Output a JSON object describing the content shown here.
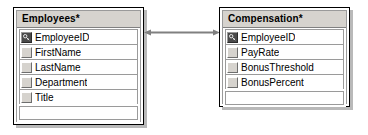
{
  "diagram": {
    "type": "database-relationship-diagram",
    "background_color": "#ffffff",
    "header_color": "#d6d3ce",
    "border_color": "#000000",
    "shadow_color": "#b9b9b9",
    "line_color": "#808080"
  },
  "tables": [
    {
      "title": "Employees*",
      "fields": [
        {
          "name": "EmployeeID",
          "is_primary_key": true
        },
        {
          "name": "FirstName",
          "is_primary_key": false
        },
        {
          "name": "LastName",
          "is_primary_key": false
        },
        {
          "name": "Department",
          "is_primary_key": false
        },
        {
          "name": "Title",
          "is_primary_key": false
        }
      ]
    },
    {
      "title": "Compensation*",
      "fields": [
        {
          "name": "EmployeeID",
          "is_primary_key": true
        },
        {
          "name": "PayRate",
          "is_primary_key": false
        },
        {
          "name": "BonusThreshold",
          "is_primary_key": false
        },
        {
          "name": "BonusPercent",
          "is_primary_key": false
        }
      ]
    }
  ],
  "relationship": {
    "from_table": "Employees*",
    "from_field": "EmployeeID",
    "to_table": "Compensation*",
    "to_field": "EmployeeID",
    "style": "bidirectional-arrow",
    "color": "#808080"
  },
  "icons": {
    "primary_key": "key-icon"
  }
}
